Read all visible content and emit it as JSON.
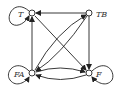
{
  "diagram": {
    "type": "directed-graph",
    "nodes": [
      {
        "id": "T",
        "label": "T",
        "x": 32,
        "y": 13
      },
      {
        "id": "TB",
        "label": "TB",
        "x": 89,
        "y": 13
      },
      {
        "id": "FA",
        "label": "FA",
        "x": 32,
        "y": 73
      },
      {
        "id": "F",
        "label": "F",
        "x": 89,
        "y": 73
      }
    ],
    "edges": [
      {
        "from": "T",
        "to": "T",
        "kind": "self-loop"
      },
      {
        "from": "TB",
        "to": "T"
      },
      {
        "from": "FA",
        "to": "T"
      },
      {
        "from": "T",
        "to": "F"
      },
      {
        "from": "TB",
        "to": "F"
      },
      {
        "from": "TB",
        "to": "FA"
      },
      {
        "from": "FA",
        "to": "TB"
      },
      {
        "from": "FA",
        "to": "F"
      },
      {
        "from": "F",
        "to": "FA"
      },
      {
        "from": "FA",
        "to": "FA",
        "kind": "self-loop"
      },
      {
        "from": "F",
        "to": "F",
        "kind": "self-loop"
      }
    ],
    "colors": {
      "stroke": "#222222",
      "node_fill": "#ffffff",
      "label": "#333333"
    }
  }
}
